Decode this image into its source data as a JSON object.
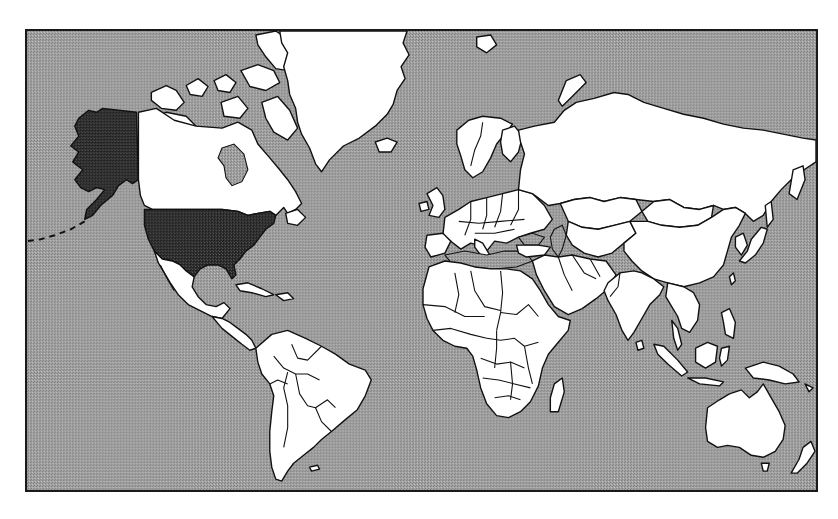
{
  "map": {
    "projection": "Mercator",
    "style": "monochrome dithered",
    "colors": {
      "ocean": "#9c9c9c",
      "ocean_dither_light": "#b4b4b4",
      "ocean_dither_dark": "#7e7e7e",
      "land": "#ffffff",
      "outline": "#111111",
      "highlight": "#2e2e2e",
      "highlight_dither": "#555555",
      "frame": "#1a1a1a"
    },
    "highlighted_regions": [
      {
        "name": "United States (contiguous)",
        "fill": "highlight"
      },
      {
        "name": "Alaska",
        "fill": "highlight"
      }
    ],
    "visible_regions": [
      "North America",
      "Greenland",
      "Iceland",
      "South America",
      "Europe",
      "Africa",
      "Madagascar",
      "Middle East",
      "Russia",
      "Central Asia",
      "India",
      "Sri Lanka",
      "China",
      "Mongolia",
      "Japan",
      "Southeast Asia",
      "Indonesia",
      "Philippines",
      "Papua New Guinea",
      "Australia",
      "Tasmania",
      "New Zealand",
      "Canadian Arctic Archipelago",
      "Svalbard",
      "Novaya Zemlya"
    ]
  }
}
